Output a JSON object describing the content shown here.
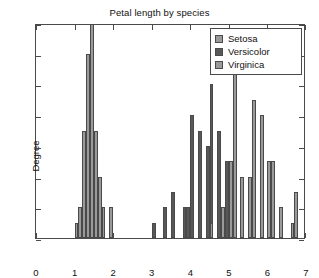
{
  "chart_data": {
    "type": "bar",
    "title": "Petal length by species",
    "xlabel": "",
    "ylabel": "Degree",
    "xlim": [
      0,
      7
    ],
    "ylim": [
      0,
      14
    ],
    "xticks": [
      "0",
      "1",
      "2",
      "3",
      "4",
      "5",
      "6",
      "7"
    ],
    "yticks": [
      "0",
      "2",
      "4",
      "6",
      "8",
      "10",
      "12",
      "14"
    ],
    "grid": false,
    "legend_position": "top-right",
    "bin_width": 0.1,
    "series": [
      {
        "name": "Setosa",
        "color": "#9a9a9a",
        "bins": [
          1.0,
          1.1,
          1.2,
          1.3,
          1.4,
          1.5,
          1.6,
          1.7,
          1.9
        ],
        "values": [
          1,
          2,
          7,
          12,
          14,
          7,
          4,
          2,
          2
        ]
      },
      {
        "name": "Versicolor",
        "color": "#585858",
        "bins": [
          3.0,
          3.3,
          3.5,
          3.8,
          3.9,
          4.0,
          4.2,
          4.4,
          4.5,
          4.7,
          4.9,
          5.0,
          5.1
        ],
        "values": [
          1,
          2,
          3,
          2,
          2,
          8,
          7,
          6,
          10,
          7,
          5,
          4,
          1
        ]
      },
      {
        "name": "Virginica",
        "color": "#9a9a9a",
        "bins": [
          4.5,
          4.8,
          5.0,
          5.1,
          5.3,
          5.5,
          5.6,
          5.8,
          6.0,
          6.1,
          6.3,
          6.6,
          6.7
        ],
        "values": [
          1,
          2,
          5,
          12,
          4,
          4,
          9,
          8,
          5,
          5,
          2,
          1,
          3
        ]
      }
    ]
  },
  "legend": {
    "items": [
      {
        "label": "Setosa",
        "key": "setosa"
      },
      {
        "label": "Versicolor",
        "key": "versicolor"
      },
      {
        "label": "Virginica",
        "key": "virginica"
      }
    ]
  }
}
